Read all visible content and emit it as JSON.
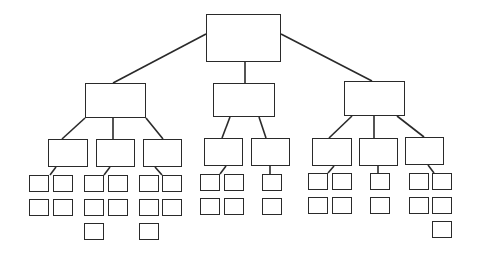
{
  "diagram": {
    "type": "org-chart-tree",
    "stroke_color": "#2a2a2a",
    "background": "#ffffff",
    "nodes": [
      {
        "id": "root",
        "level": 1,
        "label": "",
        "x": 206,
        "y": 14,
        "w": 75,
        "h": 48
      },
      {
        "id": "L",
        "level": 2,
        "parent": "root",
        "label": "",
        "x": 85,
        "y": 83,
        "w": 61,
        "h": 35
      },
      {
        "id": "M",
        "level": 2,
        "parent": "root",
        "label": "",
        "x": 213,
        "y": 83,
        "w": 62,
        "h": 34
      },
      {
        "id": "R",
        "level": 2,
        "parent": "root",
        "label": "",
        "x": 344,
        "y": 81,
        "w": 61,
        "h": 35
      },
      {
        "id": "L1",
        "level": 3,
        "parent": "L",
        "label": "",
        "x": 48,
        "y": 139,
        "w": 40,
        "h": 28
      },
      {
        "id": "L2",
        "level": 3,
        "parent": "L",
        "label": "",
        "x": 96,
        "y": 139,
        "w": 39,
        "h": 28
      },
      {
        "id": "L3",
        "level": 3,
        "parent": "L",
        "label": "",
        "x": 143,
        "y": 139,
        "w": 39,
        "h": 28
      },
      {
        "id": "M1",
        "level": 3,
        "parent": "M",
        "label": "",
        "x": 204,
        "y": 138,
        "w": 39,
        "h": 28
      },
      {
        "id": "M2",
        "level": 3,
        "parent": "M",
        "label": "",
        "x": 251,
        "y": 138,
        "w": 39,
        "h": 28
      },
      {
        "id": "R1",
        "level": 3,
        "parent": "R",
        "label": "",
        "x": 312,
        "y": 138,
        "w": 40,
        "h": 28
      },
      {
        "id": "R2",
        "level": 3,
        "parent": "R",
        "label": "",
        "x": 359,
        "y": 138,
        "w": 39,
        "h": 28
      },
      {
        "id": "R3",
        "level": 3,
        "parent": "R",
        "label": "",
        "x": 405,
        "y": 137,
        "w": 39,
        "h": 28
      },
      {
        "id": "L1a",
        "level": 4,
        "parent": "L1",
        "label": "",
        "x": 29,
        "y": 175,
        "w": 20,
        "h": 17
      },
      {
        "id": "L1b",
        "level": 4,
        "parent": "L1",
        "label": "",
        "x": 53,
        "y": 175,
        "w": 20,
        "h": 17
      },
      {
        "id": "L1c",
        "level": 4,
        "parent": "L1",
        "label": "",
        "x": 29,
        "y": 199,
        "w": 20,
        "h": 17
      },
      {
        "id": "L1d",
        "level": 4,
        "parent": "L1",
        "label": "",
        "x": 53,
        "y": 199,
        "w": 20,
        "h": 17
      },
      {
        "id": "L2a",
        "level": 4,
        "parent": "L2",
        "label": "",
        "x": 84,
        "y": 175,
        "w": 20,
        "h": 17
      },
      {
        "id": "L2b",
        "level": 4,
        "parent": "L2",
        "label": "",
        "x": 108,
        "y": 175,
        "w": 20,
        "h": 17
      },
      {
        "id": "L2c",
        "level": 4,
        "parent": "L2",
        "label": "",
        "x": 84,
        "y": 199,
        "w": 20,
        "h": 17
      },
      {
        "id": "L2d",
        "level": 4,
        "parent": "L2",
        "label": "",
        "x": 108,
        "y": 199,
        "w": 20,
        "h": 17
      },
      {
        "id": "L2e",
        "level": 4,
        "parent": "L2",
        "label": "",
        "x": 84,
        "y": 223,
        "w": 20,
        "h": 17
      },
      {
        "id": "L3a",
        "level": 4,
        "parent": "L3",
        "label": "",
        "x": 139,
        "y": 175,
        "w": 20,
        "h": 17
      },
      {
        "id": "L3b",
        "level": 4,
        "parent": "L3",
        "label": "",
        "x": 162,
        "y": 175,
        "w": 20,
        "h": 17
      },
      {
        "id": "L3c",
        "level": 4,
        "parent": "L3",
        "label": "",
        "x": 139,
        "y": 199,
        "w": 20,
        "h": 17
      },
      {
        "id": "L3d",
        "level": 4,
        "parent": "L3",
        "label": "",
        "x": 162,
        "y": 199,
        "w": 20,
        "h": 17
      },
      {
        "id": "L3e",
        "level": 4,
        "parent": "L3",
        "label": "",
        "x": 139,
        "y": 223,
        "w": 20,
        "h": 17
      },
      {
        "id": "M1a",
        "level": 4,
        "parent": "M1",
        "label": "",
        "x": 200,
        "y": 174,
        "w": 20,
        "h": 17
      },
      {
        "id": "M1b",
        "level": 4,
        "parent": "M1",
        "label": "",
        "x": 224,
        "y": 174,
        "w": 20,
        "h": 17
      },
      {
        "id": "M1c",
        "level": 4,
        "parent": "M1",
        "label": "",
        "x": 200,
        "y": 198,
        "w": 20,
        "h": 17
      },
      {
        "id": "M1d",
        "level": 4,
        "parent": "M1",
        "label": "",
        "x": 224,
        "y": 198,
        "w": 20,
        "h": 17
      },
      {
        "id": "M2a",
        "level": 4,
        "parent": "M2",
        "label": "",
        "x": 262,
        "y": 174,
        "w": 20,
        "h": 17
      },
      {
        "id": "M2b",
        "level": 4,
        "parent": "M2",
        "label": "",
        "x": 262,
        "y": 198,
        "w": 20,
        "h": 17
      },
      {
        "id": "R1a",
        "level": 4,
        "parent": "R1",
        "label": "",
        "x": 308,
        "y": 173,
        "w": 20,
        "h": 17
      },
      {
        "id": "R1b",
        "level": 4,
        "parent": "R1",
        "label": "",
        "x": 332,
        "y": 173,
        "w": 20,
        "h": 17
      },
      {
        "id": "R1c",
        "level": 4,
        "parent": "R1",
        "label": "",
        "x": 308,
        "y": 197,
        "w": 20,
        "h": 17
      },
      {
        "id": "R1d",
        "level": 4,
        "parent": "R1",
        "label": "",
        "x": 332,
        "y": 197,
        "w": 20,
        "h": 17
      },
      {
        "id": "R2a",
        "level": 4,
        "parent": "R2",
        "label": "",
        "x": 370,
        "y": 173,
        "w": 20,
        "h": 17
      },
      {
        "id": "R2b",
        "level": 4,
        "parent": "R2",
        "label": "",
        "x": 370,
        "y": 197,
        "w": 20,
        "h": 17
      },
      {
        "id": "R3a",
        "level": 4,
        "parent": "R3",
        "label": "",
        "x": 409,
        "y": 173,
        "w": 20,
        "h": 17
      },
      {
        "id": "R3b",
        "level": 4,
        "parent": "R3",
        "label": "",
        "x": 432,
        "y": 173,
        "w": 20,
        "h": 17
      },
      {
        "id": "R3c",
        "level": 4,
        "parent": "R3",
        "label": "",
        "x": 409,
        "y": 197,
        "w": 20,
        "h": 17
      },
      {
        "id": "R3d",
        "level": 4,
        "parent": "R3",
        "label": "",
        "x": 432,
        "y": 197,
        "w": 20,
        "h": 17
      },
      {
        "id": "R3e",
        "level": 4,
        "parent": "R3",
        "label": "",
        "x": 432,
        "y": 221,
        "w": 20,
        "h": 17
      }
    ],
    "connectors": [
      {
        "from": "root",
        "to": "L",
        "x1": 206,
        "y1": 34,
        "x2": 113,
        "y2": 83
      },
      {
        "from": "root",
        "to": "M",
        "x1": 245,
        "y1": 62,
        "x2": 245,
        "y2": 83
      },
      {
        "from": "root",
        "to": "R",
        "x1": 281,
        "y1": 34,
        "x2": 372,
        "y2": 81
      },
      {
        "from": "L",
        "to": "L1",
        "x1": 85,
        "y1": 118,
        "x2": 62,
        "y2": 139
      },
      {
        "from": "L",
        "to": "L2",
        "x1": 113,
        "y1": 118,
        "x2": 113,
        "y2": 139
      },
      {
        "from": "L",
        "to": "L3",
        "x1": 146,
        "y1": 118,
        "x2": 163,
        "y2": 139
      },
      {
        "from": "M",
        "to": "M1",
        "x1": 230,
        "y1": 117,
        "x2": 222,
        "y2": 138
      },
      {
        "from": "M",
        "to": "M2",
        "x1": 259,
        "y1": 117,
        "x2": 266,
        "y2": 138
      },
      {
        "from": "R",
        "to": "R1",
        "x1": 352,
        "y1": 116,
        "x2": 329,
        "y2": 138
      },
      {
        "from": "R",
        "to": "R2",
        "x1": 374,
        "y1": 116,
        "x2": 374,
        "y2": 138
      },
      {
        "from": "R",
        "to": "R3",
        "x1": 397,
        "y1": 116,
        "x2": 424,
        "y2": 137
      },
      {
        "from": "L1",
        "to": "L1a",
        "x1": 56,
        "y1": 167,
        "x2": 50,
        "y2": 175
      },
      {
        "from": "L2",
        "to": "L2a",
        "x1": 110,
        "y1": 167,
        "x2": 104,
        "y2": 175
      },
      {
        "from": "L3",
        "to": "L3b",
        "x1": 155,
        "y1": 167,
        "x2": 162,
        "y2": 175
      },
      {
        "from": "M1",
        "to": "M1a",
        "x1": 226,
        "y1": 166,
        "x2": 220,
        "y2": 174
      },
      {
        "from": "M2",
        "to": "M2a",
        "x1": 270,
        "y1": 166,
        "x2": 270,
        "y2": 174
      },
      {
        "from": "R1",
        "to": "R1a",
        "x1": 334,
        "y1": 166,
        "x2": 328,
        "y2": 173
      },
      {
        "from": "R2",
        "to": "R2a",
        "x1": 378,
        "y1": 166,
        "x2": 378,
        "y2": 173
      },
      {
        "from": "R3",
        "to": "R3b",
        "x1": 428,
        "y1": 165,
        "x2": 434,
        "y2": 173
      }
    ]
  }
}
